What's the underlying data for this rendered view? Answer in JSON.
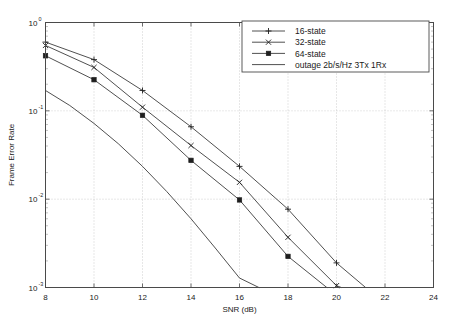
{
  "chart_data": {
    "type": "line",
    "title": "",
    "xlabel": "SNR (dB)",
    "ylabel": "Frame Error Rate",
    "xlim": [
      8,
      24
    ],
    "ylim": [
      0.001,
      1
    ],
    "yscale": "log",
    "grid": true,
    "legend_position": "top-right",
    "xticks": [
      8,
      10,
      12,
      14,
      16,
      18,
      20,
      22,
      24
    ],
    "xtick_labels": [
      "8",
      "10",
      "12",
      "14",
      "16",
      "18",
      "20",
      "22",
      "24"
    ],
    "yticks": [
      1,
      0.1,
      0.01,
      0.001
    ],
    "ytick_labels": [
      "10^0",
      "10^-1",
      "10^-2",
      "10^-3"
    ],
    "ytick_mantissa": [
      "10",
      "10",
      "10",
      "10"
    ],
    "ytick_exponent": [
      "0",
      "-1",
      "-2",
      "-3"
    ],
    "series": [
      {
        "name": "16-state",
        "marker": "plus",
        "x": [
          8,
          10,
          12,
          14,
          16,
          18,
          20,
          21.2
        ],
        "values": [
          0.6,
          0.38,
          0.17,
          0.066,
          0.0235,
          0.0077,
          0.0019,
          0.001
        ]
      },
      {
        "name": "32-state",
        "marker": "x",
        "x": [
          8,
          10,
          12,
          14,
          16,
          18,
          20,
          20.2
        ],
        "values": [
          0.55,
          0.31,
          0.11,
          0.0405,
          0.0155,
          0.0037,
          0.00105,
          0.001
        ]
      },
      {
        "name": "64-state",
        "marker": "square",
        "x": [
          8,
          10,
          12,
          14,
          16,
          18,
          19.6
        ],
        "values": [
          0.42,
          0.225,
          0.089,
          0.0275,
          0.0098,
          0.00225,
          0.001
        ]
      },
      {
        "name": "outage 2b/s/Hz 3Tx 1Rx",
        "marker": "none",
        "x": [
          8,
          9,
          10,
          11,
          12,
          13,
          14,
          15,
          16,
          16.8
        ],
        "values": [
          0.17,
          0.115,
          0.072,
          0.0425,
          0.0235,
          0.0122,
          0.006,
          0.0028,
          0.00128,
          0.001
        ]
      }
    ]
  },
  "legend": {
    "entries": [
      {
        "label": "16-state",
        "marker": "plus"
      },
      {
        "label": "32-state",
        "marker": "x"
      },
      {
        "label": "64-state",
        "marker": "square"
      },
      {
        "label": "outage 2b/s/Hz 3Tx 1Rx",
        "marker": "none"
      }
    ]
  },
  "colors": {
    "line": "#3c3c3c",
    "marker": "#1e1e1e",
    "axis": "#4a4a4a",
    "grid": "#bcbcbc",
    "background": "#ffffff"
  }
}
